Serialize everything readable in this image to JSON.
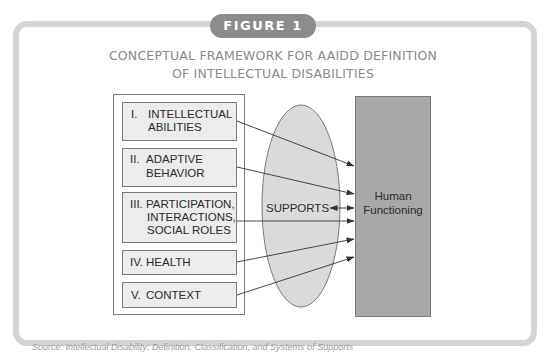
{
  "figure": {
    "label": "FIGURE 1",
    "title_line1": "CONCEPTUAL FRAMEWORK FOR AAIDD DEFINITION",
    "title_line2": "OF INTELLECTUAL DISABILITIES"
  },
  "dimensions": [
    {
      "numeral": "I.",
      "lines": [
        "INTELLECTUAL",
        "ABILITIES"
      ]
    },
    {
      "numeral": "II.",
      "lines": [
        "ADAPTIVE",
        "BEHAVIOR"
      ]
    },
    {
      "numeral": "III.",
      "lines": [
        "PARTICIPATION,",
        "INTERACTIONS,",
        "SOCIAL ROLES"
      ]
    },
    {
      "numeral": "IV.",
      "lines": [
        "HEALTH"
      ]
    },
    {
      "numeral": "V.",
      "lines": [
        "CONTEXT"
      ]
    }
  ],
  "supports": {
    "label": "SUPPORTS"
  },
  "outcome": {
    "line1": "Human",
    "line2": "Functioning"
  },
  "colors": {
    "frame": "#d4d4d4",
    "label_bg": "#8c8c8c",
    "title_text": "#8a8a8a",
    "box_fill": "#ececec",
    "ellipse_fill": "#dadada",
    "outcome_fill": "#a9a9a9"
  },
  "caption": {
    "text": "Source: Intellectual Disability: Definition, Classification, and Systems of Supports"
  }
}
